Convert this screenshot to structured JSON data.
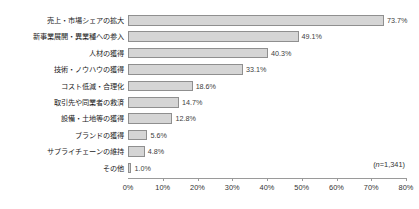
{
  "title_sliver": "",
  "chart_data": {
    "type": "bar",
    "orientation": "horizontal",
    "title": "",
    "xlabel": "",
    "ylabel": "",
    "xlim": [
      0,
      80
    ],
    "grid": false,
    "legend": null,
    "unit": "%",
    "annotation": "(n=1,341)",
    "annotation_prefix": "(",
    "annotation_italic": "n",
    "annotation_suffix": "=1,341)",
    "categories": [
      "売上・市場シェアの拡大",
      "新事業展開・異業種への参入",
      "人材の獲得",
      "技術・ノウハウの獲得",
      "コスト低減・合理化",
      "取引先や同業者の救済",
      "設備・土地等の獲得",
      "ブランドの獲得",
      "サプライチェーンの維持",
      "その他"
    ],
    "values": [
      73.7,
      49.1,
      40.3,
      33.1,
      18.6,
      14.7,
      12.8,
      5.6,
      4.8,
      1.0
    ],
    "value_labels": [
      "73.7%",
      "49.1%",
      "40.3%",
      "33.1%",
      "18.6%",
      "14.7%",
      "12.8%",
      "5.6%",
      "4.8%",
      "1.0%"
    ],
    "xticks": [
      0,
      10,
      20,
      30,
      40,
      50,
      60,
      70,
      80
    ],
    "xtick_labels": [
      "0%",
      "10%",
      "20%",
      "30%",
      "40%",
      "50%",
      "60%",
      "70%",
      "80%"
    ],
    "colors": {
      "bar_fill": "#d5d5d5",
      "bar_border": "#8f8f8f",
      "axis": "#9a9a9a",
      "text": "#1a1a1a",
      "background": "#ffffff"
    }
  }
}
